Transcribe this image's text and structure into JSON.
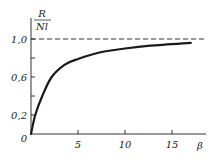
{
  "chart_data": {
    "type": "line",
    "title": "",
    "xlabel": "β",
    "ylabel": "R / Nl",
    "ylabel_numerator": "R",
    "ylabel_denominator": "Nl",
    "xlim": [
      0,
      18.5
    ],
    "ylim": [
      0,
      1.05
    ],
    "x_ticks": [
      5,
      10,
      15
    ],
    "x_tick_labels": [
      "5",
      "10",
      "15"
    ],
    "y_ticks": [
      0,
      0.2,
      0.4,
      0.6,
      0.8,
      1.0
    ],
    "y_tick_labels": [
      "0",
      "0,2",
      "",
      "0,6",
      "",
      "1,0"
    ],
    "grid": false,
    "legend": null,
    "series": [
      {
        "name": "R/Nl vs β",
        "x": [
          0,
          0.45,
          1.2,
          2.2,
          3.6,
          5,
          7.4,
          10,
          12.7,
          17
        ],
        "values": [
          0,
          0.2,
          0.4,
          0.6,
          0.73,
          0.79,
          0.86,
          0.9,
          0.93,
          0.96
        ]
      }
    ],
    "annotations": [
      {
        "type": "hline",
        "y": 1.0,
        "style": "dashed",
        "label": "asymptote 1,0"
      }
    ]
  },
  "colors": {
    "line": "#1a1a1a",
    "axis": "#333333",
    "background": "#ffffff"
  }
}
